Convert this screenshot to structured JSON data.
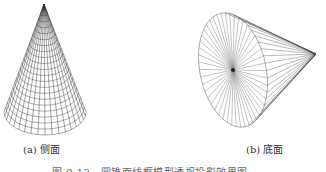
{
  "figure": {
    "subfigures": [
      {
        "id": "a",
        "label": "(a) 侧面",
        "description": "cone wireframe, side view (apex up)"
      },
      {
        "id": "b",
        "label": "(b) 底面",
        "description": "cone wireframe, base view (apex right)"
      }
    ],
    "caption": "图 9.13　圆锥面线框模型透视投影效果图"
  },
  "colors": {
    "wire": "#333333",
    "wire_light": "#888888",
    "background": "#ffffff"
  }
}
